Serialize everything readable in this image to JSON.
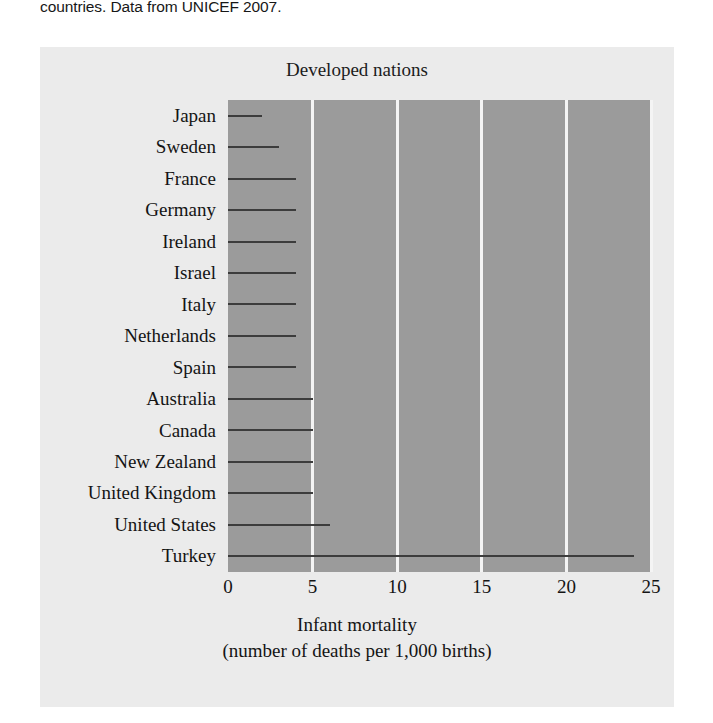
{
  "caption": {
    "clipped_line": "",
    "text": "countries. Data from UNICEF 2007."
  },
  "figure": {
    "title": "Developed nations",
    "x_axis_title_line1": "Infant mortality",
    "x_axis_title_line2": "(number of deaths per 1,000 births)",
    "plot_background": "#9b9b9b",
    "gridline_color": "#f4f4f4",
    "bar_color": "#3c3c3c",
    "card_background": "#ebebeb"
  },
  "chart_data": {
    "type": "bar",
    "orientation": "horizontal",
    "title": "Developed nations",
    "xlabel": "Infant mortality (number of deaths per 1,000 births)",
    "ylabel": "",
    "xlim": [
      0,
      25
    ],
    "xticks": [
      0,
      5,
      10,
      15,
      20,
      25
    ],
    "grid": true,
    "legend": null,
    "categories": [
      "Japan",
      "Sweden",
      "France",
      "Germany",
      "Ireland",
      "Israel",
      "Italy",
      "Netherlands",
      "Spain",
      "Australia",
      "Canada",
      "New Zealand",
      "United Kingdom",
      "United States",
      "Turkey"
    ],
    "values": [
      2,
      3,
      4,
      4,
      4,
      4,
      4,
      4,
      4,
      5,
      5,
      5,
      5,
      6,
      24
    ]
  }
}
